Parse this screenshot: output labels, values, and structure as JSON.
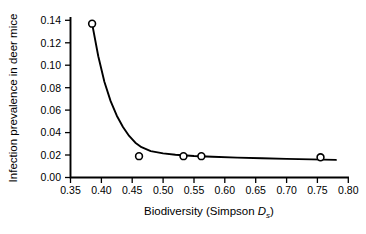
{
  "chart_data": {
    "type": "scatter",
    "title": "",
    "xlabel": "Biodiversity (Simpson Ds)",
    "xlabel_parts": {
      "prefix": "Biodiversity (Simpson ",
      "symbol": "D",
      "subscript": "s",
      "suffix": ")"
    },
    "ylabel": "Infection prevalence in deer mice",
    "xlim": [
      0.35,
      0.8
    ],
    "ylim": [
      0.0,
      0.14
    ],
    "grid": false,
    "legend": "none",
    "xticks": [
      "0.35",
      "0.40",
      "0.45",
      "0.50",
      "0.55",
      "0.60",
      "0.65",
      "0.70",
      "0.75",
      "0.80"
    ],
    "xtick_values": [
      0.35,
      0.4,
      0.45,
      0.5,
      0.55,
      0.6,
      0.65,
      0.7,
      0.75,
      0.8
    ],
    "yticks": [
      "0.00",
      "0.02",
      "0.04",
      "0.06",
      "0.08",
      "0.10",
      "0.12",
      "0.14"
    ],
    "ytick_values": [
      0.0,
      0.02,
      0.04,
      0.06,
      0.08,
      0.1,
      0.12,
      0.14
    ],
    "points": [
      {
        "x": 0.385,
        "y": 0.137
      },
      {
        "x": 0.461,
        "y": 0.019
      },
      {
        "x": 0.533,
        "y": 0.019
      },
      {
        "x": 0.562,
        "y": 0.019
      },
      {
        "x": 0.755,
        "y": 0.018
      }
    ],
    "series": [
      {
        "name": "observed prevalence",
        "marker": "open-circle",
        "x": [
          0.385,
          0.461,
          0.533,
          0.562,
          0.755
        ],
        "values": [
          0.137,
          0.019,
          0.019,
          0.019,
          0.018
        ]
      },
      {
        "name": "fitted decay curve",
        "type": "line",
        "x": [
          0.385,
          0.395,
          0.405,
          0.415,
          0.425,
          0.435,
          0.445,
          0.455,
          0.465,
          0.48,
          0.5,
          0.52,
          0.55,
          0.58,
          0.62,
          0.66,
          0.7,
          0.74,
          0.78
        ],
        "values": [
          0.137,
          0.108,
          0.085,
          0.068,
          0.055,
          0.045,
          0.037,
          0.031,
          0.027,
          0.0235,
          0.0215,
          0.0203,
          0.0192,
          0.0185,
          0.0177,
          0.0171,
          0.0166,
          0.0161,
          0.0157
        ]
      }
    ],
    "colors": {
      "axis": "#000000",
      "curve": "#000000",
      "marker_edge": "#000000",
      "marker_fill": "#ffffff",
      "background": "#ffffff"
    }
  }
}
